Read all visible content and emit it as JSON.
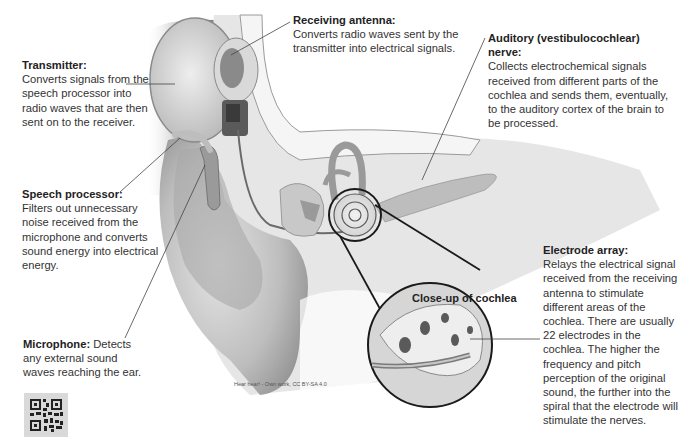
{
  "diagram": {
    "credit": "Hear hear! - Own work, CC BY-SA 4.0",
    "closeup_label": "Close-up of cochlea"
  },
  "labels": {
    "transmitter": {
      "title": "Transmitter:",
      "body": "Converts signals from the speech processor into radio waves that are then sent on to the receiver."
    },
    "receiving_antenna": {
      "title": "Receiving antenna:",
      "body": "Converts radio waves sent by the transmitter into electrical signals."
    },
    "auditory_nerve": {
      "title": "Auditory (vestibulocochlear) nerve:",
      "body": "Collects electrochemical signals received from different parts of the cochlea and sends them, eventually, to the auditory cortex of the brain to be processed."
    },
    "speech_processor": {
      "title": "Speech processor:",
      "body": "Filters out unnecessary noise received from the microphone and converts sound energy into electrical energy."
    },
    "microphone": {
      "title": "Microphone:",
      "body": " Detects any external sound waves reaching the ear."
    },
    "electrode_array": {
      "title": "Electrode array:",
      "body": "Relays the electrical signal received from the receiving antenna to stimulate different areas of the cochlea. There are usually 22 electrodes in the cochlea. The higher the frequency and pitch perception of the original sound, the further into the spiral that the electrode will stimulate the nerves."
    }
  },
  "icons": {
    "qr": "qr-code-icon"
  },
  "colors": {
    "background": "#ffffff",
    "text": "#333333",
    "leader_line": "#444444",
    "illustration_gray": "#bdbdbd"
  }
}
